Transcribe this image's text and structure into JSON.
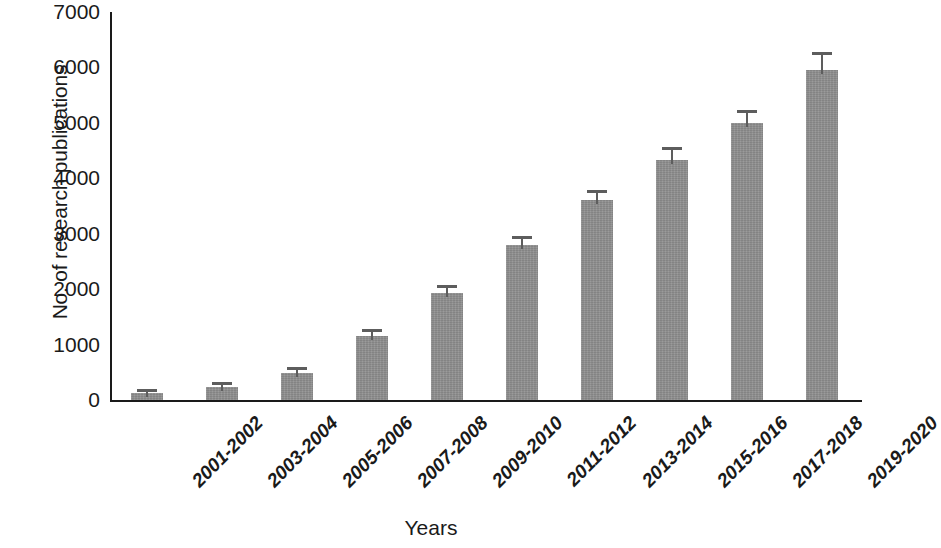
{
  "chart_data": {
    "type": "bar",
    "title": "",
    "xlabel": "Years",
    "ylabel": "No. of research publications",
    "categories": [
      "2001-2002",
      "2003-2004",
      "2005-2006",
      "2007-2008",
      "2009-2010",
      "2011-2012",
      "2013-2014",
      "2015-2016",
      "2017-2018",
      "2019-2020"
    ],
    "values": [
      120,
      230,
      490,
      1160,
      1930,
      2790,
      3600,
      4330,
      4990,
      5950
    ],
    "errors": [
      30,
      40,
      45,
      70,
      90,
      120,
      130,
      180,
      190,
      270
    ],
    "ylim": [
      0,
      7000
    ],
    "yticks": [
      0,
      1000,
      2000,
      3000,
      4000,
      5000,
      6000,
      7000
    ],
    "ytick_labels": [
      "0",
      "1000",
      "2000",
      "3000",
      "4000",
      "5000",
      "6000",
      "7000"
    ],
    "grid": false,
    "legend": false,
    "bar_color": "#8f8f8f",
    "error_color": "#5d5d5d",
    "axis_color": "#1a1a1a"
  }
}
